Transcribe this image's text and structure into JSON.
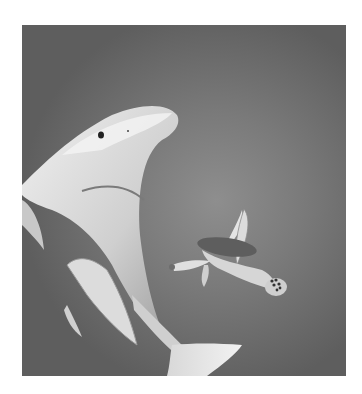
{
  "image": {
    "description": "Pencil drawing of a great white shark swimming upward on the left with a sea turtle swimming to the right",
    "subjects": [
      "shark",
      "sea-turtle"
    ],
    "palette": {
      "background": "#ffffff",
      "water_light": "#8e8e8e",
      "water_dark": "#5e5e5e",
      "shark_light": "#e6e6e6",
      "shark_shadow": "#a8a8a8",
      "turtle_shell": "#6a6a6a",
      "turtle_skin": "#d8d8d8"
    }
  }
}
